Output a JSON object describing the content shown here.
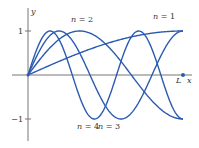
{
  "chart_data": {
    "type": "line",
    "title": "",
    "xlabel": "x",
    "ylabel": "y",
    "x_end_label": "L",
    "y_ticks": [
      {
        "value": 1,
        "label": "1"
      },
      {
        "value": -1,
        "label": "-1"
      }
    ],
    "xlim": [
      0,
      1
    ],
    "ylim": [
      -1.5,
      1.5
    ],
    "grid": false,
    "legend": "inline labels",
    "function": "y = sin((2n-1)·π·x / (2L))",
    "series": [
      {
        "name": "n = 1",
        "k": 1,
        "label_pos": [
          164,
          19
        ]
      },
      {
        "name": "n = 2",
        "k": 3,
        "label_pos": [
          82,
          22
        ]
      },
      {
        "name": "n = 3",
        "k": 5,
        "label_pos": [
          109,
          129
        ]
      },
      {
        "name": "n = 4",
        "k": 7,
        "label_pos": [
          88,
          129
        ]
      }
    ],
    "color": "#2a5bb0"
  },
  "layout": {
    "origin": [
      28,
      75
    ],
    "x_L_px": 155,
    "amp_px": 44,
    "axis_color": "#777777"
  }
}
